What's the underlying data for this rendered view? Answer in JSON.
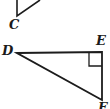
{
  "figure": {
    "background_color": "#ffffff",
    "stroke_color": "#1c1c1c",
    "label_color": "#1a1a1a",
    "canvas": {
      "width": 110,
      "height": 109
    },
    "shapes": [
      {
        "id": "partial-triangle-c",
        "name": "partial-triangle-top",
        "description": "Partial triangle cropped by the top edge of the image",
        "type": "polyline",
        "closed": false,
        "stroke_width": 1.6,
        "points": [
          {
            "x": 17,
            "y": 0
          },
          {
            "x": 17,
            "y": 16
          },
          {
            "x": 40,
            "y": 0
          }
        ]
      },
      {
        "id": "right-triangle-def",
        "name": "right-triangle-def",
        "description": "Right triangle DEF with the right angle at vertex E",
        "type": "polygon",
        "closed": true,
        "stroke_width": 1.8,
        "points": [
          {
            "x": 17,
            "y": 53
          },
          {
            "x": 102,
            "y": 52
          },
          {
            "x": 102,
            "y": 100
          }
        ]
      }
    ],
    "right_angle_marker": {
      "id": "right-angle-e",
      "name": "right-angle-marker-e",
      "at_vertex": "E",
      "stroke_width": 1.3,
      "size": 13,
      "points": [
        {
          "x": 89,
          "y": 53
        },
        {
          "x": 89,
          "y": 66
        },
        {
          "x": 102,
          "y": 66
        }
      ]
    },
    "labels": [
      {
        "id": "label-c",
        "name": "vertex-label-c",
        "text": "C",
        "x": 9,
        "y": 18,
        "font_size": 13
      },
      {
        "id": "label-d",
        "name": "vertex-label-d",
        "text": "D",
        "x": 2,
        "y": 44,
        "font_size": 13
      },
      {
        "id": "label-e",
        "name": "vertex-label-e",
        "text": "E",
        "x": 96,
        "y": 34,
        "font_size": 13
      },
      {
        "id": "label-f",
        "name": "vertex-label-f",
        "text": "F",
        "x": 98,
        "y": 101,
        "font_size": 13
      }
    ]
  }
}
